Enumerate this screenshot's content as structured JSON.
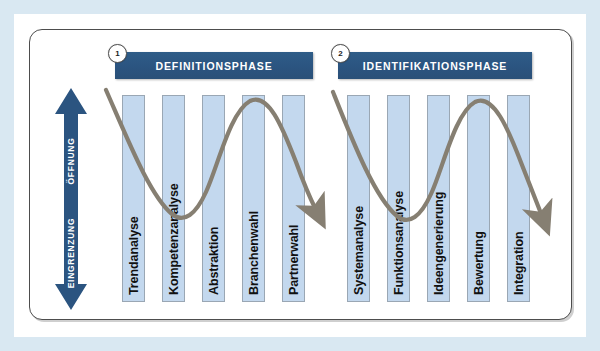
{
  "diagram": {
    "title_hidden": "",
    "axis": {
      "name": "oeffnung-eingrenzung-arrow",
      "top_label": "ÖFFNUNG",
      "bottom_label": "EINGRENZUNG",
      "color": "#2b5480"
    },
    "colors": {
      "header_blue": "#2b5480",
      "bar_fill": "#c3d8ee",
      "bar_border": "#9aa7b4",
      "curve": "#867f72",
      "card_border": "#4d4d4d",
      "outer_frame": "#d9e8f2"
    },
    "phases": [
      {
        "badge": "1",
        "header": "DEFINITIONSPHASE",
        "steps": [
          {
            "label": "Trendanalyse"
          },
          {
            "label": "Kompetenzanalyse"
          },
          {
            "label": "Abstraktion"
          },
          {
            "label": "Branchenwahl"
          },
          {
            "label": "Partnerwahl"
          }
        ]
      },
      {
        "badge": "2",
        "header": "IDENTIFIKATIONSPHASE",
        "steps": [
          {
            "label": "Systemanalyse"
          },
          {
            "label": "Funktionsanalyse"
          },
          {
            "label": "Ideengenerierung"
          },
          {
            "label": "Bewertung"
          },
          {
            "label": "Integration"
          }
        ]
      }
    ]
  }
}
